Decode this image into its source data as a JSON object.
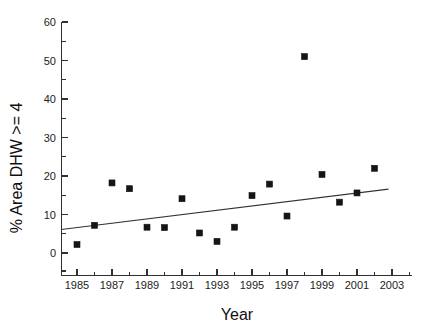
{
  "chart_data": {
    "type": "scatter",
    "title": "",
    "xlabel": "Year",
    "ylabel": "% Area DHW >= 4",
    "xlim": [
      1983.5,
      2003.5
    ],
    "ylim": [
      0,
      60
    ],
    "grid": false,
    "legend": null,
    "x_ticks": [
      1985,
      1987,
      1989,
      1991,
      1993,
      1995,
      1997,
      1999,
      2001,
      2003
    ],
    "x_tick_labels": [
      "1985",
      "1987",
      "1989",
      "1991",
      "1993",
      "1995",
      "1997",
      "1999",
      "2001",
      "2003"
    ],
    "x_minor_ticks": [
      1984,
      1986,
      1988,
      1990,
      1992,
      1994,
      1996,
      1998,
      2000,
      2002
    ],
    "y_ticks": [
      0,
      10,
      20,
      30,
      40,
      50,
      60
    ],
    "y_tick_labels": [
      "0",
      "10",
      "20",
      "30",
      "40",
      "50",
      "60"
    ],
    "y_minor_ticks": [
      5,
      15,
      25,
      35,
      45,
      55
    ],
    "marker_shape": "square",
    "marker_color": "#151515",
    "marker_size": 6,
    "x": [
      1985,
      1986,
      1987,
      1988,
      1989,
      1990,
      1991,
      1992,
      1993,
      1994,
      1995,
      1996,
      1997,
      1998,
      1999,
      2000,
      2001,
      2002
    ],
    "values": [
      2.2,
      7.2,
      18.2,
      16.7,
      6.7,
      6.6,
      14.1,
      5.2,
      3.0,
      6.7,
      14.9,
      17.9,
      9.6,
      51.0,
      20.4,
      13.2,
      15.6,
      22.0
    ],
    "series": [
      {
        "name": "% Area DHW >= 4",
        "values": [
          2.2,
          7.2,
          18.2,
          16.7,
          6.7,
          6.6,
          14.1,
          5.2,
          3.0,
          6.7,
          14.9,
          17.9,
          9.6,
          51.0,
          20.4,
          13.2,
          15.6,
          22.0
        ]
      }
    ],
    "annotations": [],
    "trend_line": {
      "type": "linear-fit",
      "color": "#333333",
      "x_start": 1984.1,
      "y_start": 6.1,
      "x_end": 2002.8,
      "y_end": 16.6
    }
  }
}
